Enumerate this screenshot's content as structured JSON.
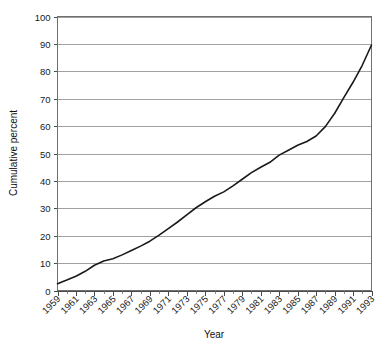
{
  "chart_data": {
    "type": "line",
    "title": "",
    "xlabel": "Year",
    "ylabel": "Cumulative percent",
    "xlim": [
      1959,
      1993
    ],
    "ylim": [
      0,
      100
    ],
    "grid": true,
    "legend": null,
    "y_ticks": [
      0,
      10,
      20,
      30,
      40,
      50,
      60,
      70,
      80,
      90,
      100
    ],
    "x_ticks": [
      1959,
      1961,
      1963,
      1965,
      1967,
      1969,
      1971,
      1973,
      1975,
      1977,
      1979,
      1981,
      1983,
      1985,
      1987,
      1989,
      1991,
      1993
    ],
    "x_minor_tick_step": 1,
    "x": [
      1959,
      1960,
      1961,
      1962,
      1963,
      1964,
      1965,
      1966,
      1967,
      1968,
      1969,
      1970,
      1971,
      1972,
      1973,
      1974,
      1975,
      1976,
      1977,
      1978,
      1979,
      1980,
      1981,
      1982,
      1983,
      1984,
      1985,
      1986,
      1987,
      1988,
      1989,
      1990,
      1991,
      1992,
      1993
    ],
    "values": [
      2.5,
      3.8,
      5.2,
      7.0,
      9.2,
      10.8,
      11.6,
      13.0,
      14.6,
      16.2,
      18.0,
      20.2,
      22.6,
      25.0,
      27.6,
      30.2,
      32.4,
      34.4,
      36.0,
      38.2,
      40.6,
      43.0,
      45.0,
      46.8,
      49.4,
      51.2,
      53.0,
      54.4,
      56.4,
      59.8,
      64.6,
      70.4,
      76.0,
      82.2,
      89.6
    ],
    "series_name": "Cumulative percent",
    "line_color": "#1a1a1a"
  },
  "axes": {
    "y_axis_title": "Cumulative percent",
    "x_axis_title": "Year",
    "y_tick_labels": [
      "0",
      "10",
      "20",
      "30",
      "40",
      "50",
      "60",
      "70",
      "80",
      "90",
      "100"
    ],
    "x_tick_labels": [
      "1959",
      "1961",
      "1963",
      "1965",
      "1967",
      "1969",
      "1971",
      "1973",
      "1975",
      "1977",
      "1979",
      "1981",
      "1983",
      "1985",
      "1987",
      "1989",
      "1991",
      "1993"
    ]
  },
  "colors": {
    "line": "#1a1a1a",
    "grid": "#8a8a8a",
    "frame": "#707070",
    "background": "#ffffff",
    "text": "#111111"
  }
}
